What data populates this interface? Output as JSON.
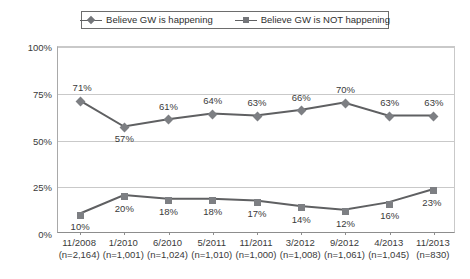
{
  "legend": {
    "position": "top-center",
    "entries": [
      {
        "label": "Believe GW is happening",
        "marker": "diamond-line-icon",
        "color": "#74767a"
      },
      {
        "label": "Believe GW is NOT happening",
        "marker": "square-line-icon",
        "color": "#74767a"
      }
    ]
  },
  "axes": {
    "y_ticks": [
      "0%",
      "25%",
      "50%",
      "75%",
      "100%"
    ],
    "y_values": [
      0,
      25,
      50,
      75,
      100
    ],
    "x_labels": [
      {
        "date": "11/2008",
        "n": "(n=2,164)"
      },
      {
        "date": "1/2010",
        "n": "(n=1,001)"
      },
      {
        "date": "6/2010",
        "n": "(n=1,024)"
      },
      {
        "date": "5/2011",
        "n": "(n=1,010)"
      },
      {
        "date": "11/2011",
        "n": "(n=1,000)"
      },
      {
        "date": "3/2012",
        "n": "(n=1,008)"
      },
      {
        "date": "9/2012",
        "n": "(n=1,061)"
      },
      {
        "date": "4/2013",
        "n": "(n=1,045)"
      },
      {
        "date": "11/2013",
        "n": "(n=830)"
      }
    ]
  },
  "chart_data": {
    "type": "line",
    "title": "",
    "xlabel": "",
    "ylabel": "",
    "ylim": [
      0,
      100
    ],
    "grid": true,
    "legend_position": "top-center",
    "categories": [
      "11/2008",
      "1/2010",
      "6/2010",
      "5/2011",
      "11/2011",
      "3/2012",
      "9/2012",
      "4/2013",
      "11/2013"
    ],
    "category_sample_sizes": [
      "(n=2,164)",
      "(n=1,001)",
      "(n=1,024)",
      "(n=1,010)",
      "(n=1,000)",
      "(n=1,008)",
      "(n=1,061)",
      "(n=1,045)",
      "(n=830)"
    ],
    "ytick_labels": [
      "0%",
      "25%",
      "50%",
      "75%",
      "100%"
    ],
    "series": [
      {
        "name": "Believe GW is happening",
        "marker": "diamond",
        "color": "#74767a",
        "values": [
          71,
          57,
          61,
          64,
          63,
          66,
          70,
          63,
          63
        ],
        "data_labels": [
          "71%",
          "57%",
          "61%",
          "64%",
          "63%",
          "66%",
          "70%",
          "63%",
          "63%"
        ]
      },
      {
        "name": "Believe GW is NOT happening",
        "marker": "square",
        "color": "#74767a",
        "values": [
          10,
          20,
          18,
          18,
          17,
          14,
          12,
          16,
          23
        ],
        "data_labels": [
          "10%",
          "20%",
          "18%",
          "18%",
          "17%",
          "14%",
          "12%",
          "16%",
          "23%"
        ]
      }
    ],
    "label_offsets": {
      "series0": [
        "above-left",
        "below",
        "above",
        "above",
        "above",
        "above",
        "above",
        "above",
        "above"
      ],
      "series1": [
        "below",
        "below",
        "below",
        "below",
        "below",
        "below",
        "below",
        "below",
        "above-right"
      ]
    }
  }
}
